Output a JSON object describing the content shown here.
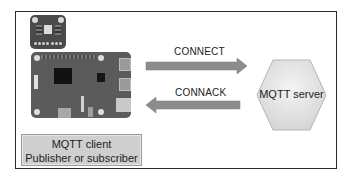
{
  "diagram": {
    "type": "mqtt-connection-handshake",
    "client": {
      "line1": "MQTT client",
      "line2": "Publisher or subscriber",
      "hardware": [
        "sensor-board",
        "single-board-computer"
      ]
    },
    "server": {
      "label": "MQTT server"
    },
    "messages": [
      {
        "label": "CONNECT",
        "direction": "client-to-server"
      },
      {
        "label": "CONNACK",
        "direction": "server-to-client"
      }
    ],
    "colors": {
      "arrow": "#8c8c8c",
      "client_box": "#cfcfcf",
      "server_hexagon": "#e6e6e6",
      "board": "#5b5b5b",
      "frame_border": "#2a2a2a"
    }
  }
}
